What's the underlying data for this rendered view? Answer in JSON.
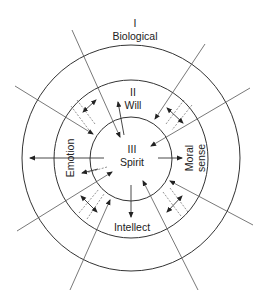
{
  "diagram": {
    "type": "concentric-circles",
    "layers": [
      {
        "numeral": "I",
        "name": "Biological",
        "position": "outer"
      },
      {
        "numeral": "II",
        "name": "Will",
        "position": "middle"
      },
      {
        "numeral": "III",
        "name": "Spirit",
        "position": "inner"
      }
    ],
    "side_labels": {
      "left": "Emotion",
      "right_line1": "Moral",
      "right_line2": "sense",
      "bottom": "Intellect"
    },
    "labels": {
      "outer_numeral": "I",
      "outer_name": "Biological",
      "middle_numeral": "II",
      "middle_name": "Will",
      "inner_numeral": "III",
      "inner_name": "Spirit"
    },
    "colors": {
      "line": "#333333",
      "background": "#ffffff"
    }
  }
}
